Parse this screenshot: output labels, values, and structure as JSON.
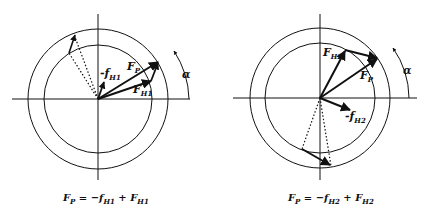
{
  "figure": {
    "left_diagram": {
      "labels": {
        "neg_f": "-f",
        "neg_f_sub": "H1",
        "fp": "F",
        "fp_sub": "P",
        "fh": "F",
        "fh_sub": "H1",
        "angle": "α"
      },
      "caption": {
        "lhs": "F",
        "lhs_sub": "P",
        "eq": " = −f",
        "mid_sub": "H1",
        "plus": " + F",
        "rhs_sub": "H1"
      }
    },
    "right_diagram": {
      "labels": {
        "fh": "F",
        "fh_sub": "H2",
        "fp": "F",
        "fp_sub": "P",
        "neg_f": "-f",
        "neg_f_sub": "H2",
        "angle": "α"
      },
      "caption": {
        "lhs": "F",
        "lhs_sub": "P",
        "eq": " = −f",
        "mid_sub": "H2",
        "plus": " + F",
        "rhs_sub": "H2"
      }
    }
  }
}
